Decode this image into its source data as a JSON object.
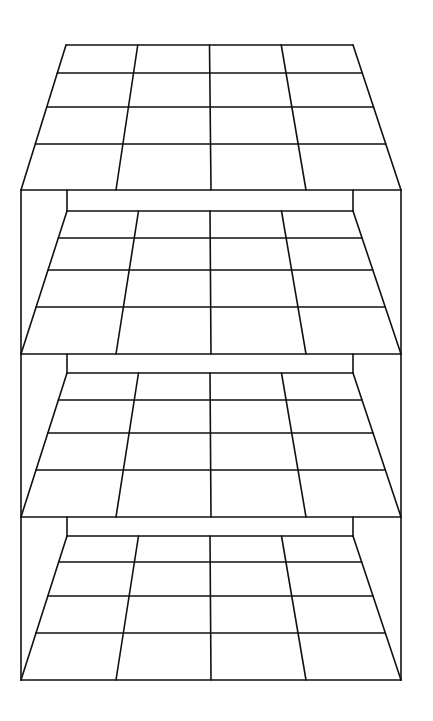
{
  "diagram": {
    "stroke_color": "#111111",
    "background": "#ffffff",
    "grid_size": 4,
    "frame": {
      "outer_left_x": 21,
      "outer_right_x": 401,
      "inner_left_x": 67,
      "inner_right_x": 353
    },
    "boards": [
      {
        "name": "board-1-top",
        "back_y": 45,
        "front_y": 190,
        "back_left_x": 66,
        "back_right_x": 353,
        "front_left_x": 21,
        "front_right_x": 401,
        "row_ys": [
          73,
          107,
          144
        ],
        "frame_top_y": null
      },
      {
        "name": "board-2",
        "back_y": 211,
        "front_y": 354,
        "back_left_x": 67,
        "back_right_x": 353,
        "front_left_x": 21,
        "front_right_x": 401,
        "row_ys": [
          238,
          270,
          307
        ],
        "frame_top_y": 190
      },
      {
        "name": "board-3",
        "back_y": 373,
        "front_y": 517,
        "back_left_x": 67,
        "back_right_x": 353,
        "front_left_x": 21,
        "front_right_x": 401,
        "row_ys": [
          400,
          433,
          470
        ],
        "frame_top_y": 354
      },
      {
        "name": "board-4-bottom",
        "back_y": 536,
        "front_y": 680,
        "back_left_x": 67,
        "back_right_x": 353,
        "front_left_x": 21,
        "front_right_x": 401,
        "row_ys": [
          562,
          596,
          633
        ],
        "frame_top_y": 517
      }
    ]
  }
}
